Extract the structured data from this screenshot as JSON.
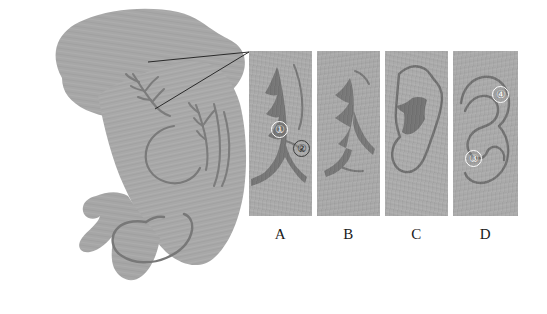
{
  "figure": {
    "type": "ultrasound-anatomical-figure",
    "width": 547,
    "height": 314,
    "background_color": "#ffffff",
    "tissue_color": "#a6a6a6",
    "tissue_color_light": "#b0b0b0",
    "vessel_color": "#7b7b7b",
    "lumen_dark_color": "#757575",
    "leader_line_color": "#1c1c1c"
  },
  "overview": {
    "name": "overview-scan",
    "description": "Large grayscale ultrasound overview of organ with branching vascular structures",
    "region_markers": []
  },
  "leader_lines": [
    {
      "name": "leader-line-upper",
      "x1": 148,
      "y1": 62,
      "x2": 249,
      "y2": 52
    },
    {
      "name": "leader-line-lower",
      "x1": 155,
      "y1": 108,
      "x2": 249,
      "y2": 52
    }
  ],
  "panels": [
    {
      "id": "A",
      "label": "A",
      "x": 249,
      "y": 51,
      "width": 63,
      "height": 165,
      "description": "Magnified view showing branching dark vascular lumen with two annotated points",
      "markers": [
        {
          "id": "1",
          "glyph": "①",
          "style": "light",
          "x": 22,
          "y": 70
        },
        {
          "id": "2",
          "glyph": "②",
          "style": "dark",
          "x": 44,
          "y": 89
        }
      ]
    },
    {
      "id": "B",
      "label": "B",
      "x": 317,
      "y": 51,
      "width": 63,
      "height": 165,
      "description": "Magnified view showing dilated dark lumen with lateral branches",
      "markers": []
    },
    {
      "id": "C",
      "label": "C",
      "x": 385,
      "y": 51,
      "width": 63,
      "height": 165,
      "description": "Magnified view showing outlined loop enclosing central dark lumen",
      "markers": []
    },
    {
      "id": "D",
      "label": "D",
      "x": 453,
      "y": 51,
      "width": 65,
      "height": 165,
      "description": "Magnified view showing S-shaped curved duct with two annotated points",
      "markers": [
        {
          "id": "3",
          "glyph": "③",
          "style": "light",
          "x": 12,
          "y": 99
        },
        {
          "id": "4",
          "glyph": "④",
          "style": "light",
          "x": 39,
          "y": 35
        }
      ]
    }
  ],
  "labels": {
    "a": "A",
    "b": "B",
    "c": "C",
    "d": "D"
  }
}
